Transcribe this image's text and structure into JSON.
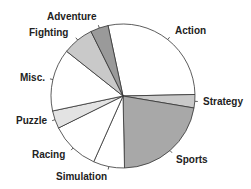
{
  "chart_data": {
    "type": "pie",
    "title": "",
    "categories": [
      "Action",
      "Strategy",
      "Sports",
      "Simulation",
      "Racing",
      "Puzzle",
      "Misc.",
      "Fighting",
      "Adventure"
    ],
    "values": [
      28,
      3,
      22,
      7,
      11,
      4,
      14,
      7,
      4
    ],
    "colors": [
      "#ffffff",
      "#c9c9c9",
      "#a8a8a8",
      "#ffffff",
      "#ffffff",
      "#e3e3e3",
      "#ffffff",
      "#c9c9c9",
      "#9a9a9a"
    ],
    "start_angle_deg": -12,
    "direction": "clockwise",
    "legend": "none (labels on slices)"
  },
  "labels": {
    "action": "Action",
    "strategy": "Strategy",
    "sports": "Sports",
    "simulation": "Simulation",
    "racing": "Racing",
    "puzzle": "Puzzle",
    "misc": "Misc.",
    "fighting": "Fighting",
    "adventure": "Adventure"
  }
}
